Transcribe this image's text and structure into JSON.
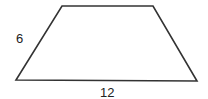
{
  "figure": {
    "shape": "trapezoid",
    "stroke_color": "#333333",
    "background": "#ffffff",
    "vertices": {
      "top_left": [
        62,
        6
      ],
      "top_right": [
        153,
        6
      ],
      "bottom_right": [
        197,
        81
      ],
      "bottom_left": [
        16,
        80
      ]
    },
    "labels": {
      "left_side": "6",
      "base": "12"
    }
  }
}
